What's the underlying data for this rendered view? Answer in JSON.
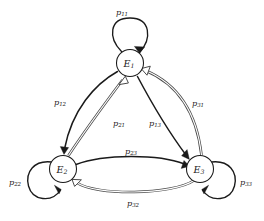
{
  "diagram": {
    "type": "markov-chain-state-transition-diagram",
    "background_color": "#ffffff",
    "stroke_color": "#1a1a1a",
    "double_line_color": "#4a4a4a",
    "states": [
      {
        "id": "E1",
        "label": "E",
        "subscript": "1",
        "position": "top",
        "cx": 130,
        "cy": 63,
        "r": 13.5
      },
      {
        "id": "E2",
        "label": "E",
        "subscript": "2",
        "position": "bottom-left",
        "cx": 63,
        "cy": 169,
        "r": 13.5
      },
      {
        "id": "E3",
        "label": "E",
        "subscript": "3",
        "position": "bottom-right",
        "cx": 200,
        "cy": 169,
        "r": 13.5
      }
    ],
    "transitions": [
      {
        "id": "p11",
        "label": "p",
        "subscript": "11",
        "from": "E1",
        "to": "E1",
        "kind": "self-loop",
        "arrow_style": "solid",
        "label_x": 122,
        "label_y": 12
      },
      {
        "id": "p22",
        "label": "p",
        "subscript": "22",
        "from": "E2",
        "to": "E2",
        "kind": "self-loop",
        "arrow_style": "solid",
        "label_x": 15,
        "label_y": 182
      },
      {
        "id": "p33",
        "label": "p",
        "subscript": "33",
        "from": "E3",
        "to": "E3",
        "kind": "self-loop",
        "arrow_style": "solid",
        "label_x": 246,
        "label_y": 182
      },
      {
        "id": "p12",
        "label": "p",
        "subscript": "12",
        "from": "E1",
        "to": "E2",
        "kind": "curve",
        "arrow_style": "solid",
        "label_x": 60,
        "label_y": 102
      },
      {
        "id": "p21",
        "label": "p",
        "subscript": "21",
        "from": "E2",
        "to": "E1",
        "kind": "curve",
        "arrow_style": "double-hollow",
        "label_x": 119,
        "label_y": 123
      },
      {
        "id": "p13",
        "label": "p",
        "subscript": "13",
        "from": "E1",
        "to": "E3",
        "kind": "curve",
        "arrow_style": "solid",
        "label_x": 155,
        "label_y": 123
      },
      {
        "id": "p31",
        "label": "p",
        "subscript": "31",
        "from": "E3",
        "to": "E1",
        "kind": "curve",
        "arrow_style": "double-hollow",
        "label_x": 198,
        "label_y": 103
      },
      {
        "id": "p23",
        "label": "p",
        "subscript": "23",
        "from": "E2",
        "to": "E3",
        "kind": "curve",
        "arrow_style": "solid",
        "label_x": 131,
        "label_y": 151
      },
      {
        "id": "p32",
        "label": "p",
        "subscript": "32",
        "from": "E3",
        "to": "E2",
        "kind": "curve",
        "arrow_style": "double-hollow",
        "label_x": 133,
        "label_y": 203
      }
    ]
  }
}
